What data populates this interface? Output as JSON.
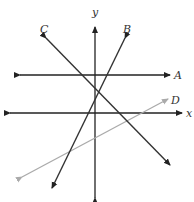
{
  "diagram": {
    "type": "coordinate-plane-lines",
    "axes": {
      "x_label": "x",
      "y_label": "y",
      "color": "#222222"
    },
    "lines": [
      {
        "name": "A",
        "description": "horizontal line above x-axis",
        "color": "#222222"
      },
      {
        "name": "B",
        "description": "steep line with positive slope",
        "color": "#333333"
      },
      {
        "name": "C",
        "description": "line with negative slope",
        "color": "#333333"
      },
      {
        "name": "D",
        "description": "line with small positive slope",
        "color": "#aaaaaa"
      }
    ]
  }
}
